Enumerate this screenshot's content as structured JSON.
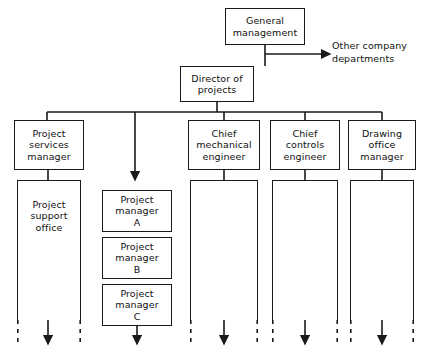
{
  "diagram": {
    "type": "org-chart",
    "canvas": {
      "width": 423,
      "height": 358
    },
    "stroke_color": "#1a1a1a",
    "text_color": "#111111",
    "background": "#ffffff"
  },
  "nodes": {
    "general_management": {
      "label": "General\nmanagement",
      "x": 225,
      "y": 8,
      "w": 80,
      "h": 37
    },
    "director_of_projects": {
      "label": "Director of\nprojects",
      "x": 180,
      "y": 66,
      "w": 74,
      "h": 36
    },
    "project_services_manager": {
      "label": "Project\nservices\nmanager",
      "x": 14,
      "y": 120,
      "w": 70,
      "h": 50
    },
    "chief_mechanical_engineer": {
      "label": "Chief\nmechanical\nengineer",
      "x": 188,
      "y": 120,
      "w": 72,
      "h": 50
    },
    "chief_controls_engineer": {
      "label": "Chief\ncontrols\nengineer",
      "x": 270,
      "y": 120,
      "w": 70,
      "h": 50
    },
    "drawing_office_manager": {
      "label": "Drawing\noffice\nmanager",
      "x": 348,
      "y": 120,
      "w": 68,
      "h": 50
    }
  },
  "open_nodes": {
    "project_support_office": {
      "label": "Project\nsupport\noffice",
      "x": 17,
      "y": 180,
      "w": 64,
      "h": 140
    },
    "mechanical_column": {
      "label": "",
      "x": 190,
      "y": 180,
      "w": 68,
      "h": 140
    },
    "controls_column": {
      "label": "",
      "x": 272,
      "y": 180,
      "w": 66,
      "h": 140
    },
    "drawing_column": {
      "label": "",
      "x": 350,
      "y": 180,
      "w": 64,
      "h": 140
    }
  },
  "project_managers": [
    {
      "label": "Project\nmanager\nA",
      "x": 102,
      "y": 190,
      "w": 70,
      "h": 42
    },
    {
      "label": "Project\nmanager\nB",
      "x": 102,
      "y": 237,
      "w": 70,
      "h": 42
    },
    {
      "label": "Project\nmanager\nC",
      "x": 102,
      "y": 284,
      "w": 70,
      "h": 42
    }
  ],
  "labels": {
    "other_company_departments": {
      "text": "Other company\ndepartments",
      "x": 332,
      "y": 40
    }
  },
  "connectors": {
    "gm_to_director_trunk": "vertical from General management down to bus",
    "gm_to_other_departments": "horizontal arrow right to Other company departments",
    "director_bus_y": 112,
    "director_bus_x1": 47,
    "director_bus_x2": 382,
    "branch_drop_x": [
      47,
      135,
      224,
      305,
      382
    ]
  },
  "flow_arrows": [
    {
      "name": "arrow-support-office",
      "x": 48,
      "y_top": 305,
      "y_bottom": 340
    },
    {
      "name": "arrow-project-managers",
      "x": 137,
      "y_top": 305,
      "y_bottom": 340
    },
    {
      "name": "arrow-mechanical",
      "x": 224,
      "y_top": 305,
      "y_bottom": 340
    },
    {
      "name": "arrow-controls",
      "x": 305,
      "y_top": 305,
      "y_bottom": 340
    },
    {
      "name": "arrow-drawing",
      "x": 382,
      "y_top": 305,
      "y_bottom": 340
    }
  ]
}
